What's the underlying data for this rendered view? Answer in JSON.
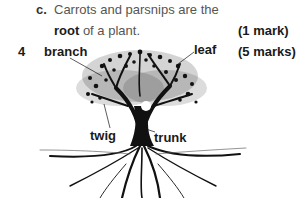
{
  "question_c": {
    "letter": "c.",
    "line1": "Carrots and parsnips are the",
    "line2_bold": "root",
    "line2_rest": " of a plant.",
    "marks": "(1 mark)"
  },
  "question_4": {
    "number": "4",
    "marks": "(5 marks)",
    "labels": {
      "branch": "branch",
      "leaf": "leaf",
      "twig": "twig",
      "trunk": "trunk"
    },
    "image": "tree-with-roots-illustration"
  }
}
